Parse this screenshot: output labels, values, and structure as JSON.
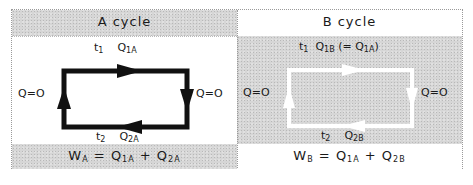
{
  "panels": {
    "a": {
      "title": "A  cycle",
      "top_label": {
        "t": "t",
        "t_sub": "1",
        "q": "Q",
        "q_sub": "1A"
      },
      "bottom_label": {
        "t": "t",
        "t_sub": "2",
        "q": "Q",
        "q_sub": "2A"
      },
      "left_label": "Q=O",
      "right_label": "Q=O",
      "formula": {
        "w": "W",
        "w_sub": "A",
        "eq": " = ",
        "q1": "Q",
        "q1_sub": "1A",
        "plus": " + ",
        "q2": "Q",
        "q2_sub": "2A"
      },
      "cycle_color": "#111111",
      "direction": "clockwise"
    },
    "b": {
      "title": "B  cycle",
      "top_label": {
        "t": "t",
        "t_sub": "1",
        "q": "Q",
        "q_sub": "1B",
        "note": "(= Q",
        "note_sub": "1A",
        "note_end": ")"
      },
      "bottom_label": {
        "t": "t",
        "t_sub": "2",
        "q": "Q",
        "q_sub": "2B"
      },
      "left_label": "Q=O",
      "right_label": "Q=O",
      "formula": {
        "w": "W",
        "w_sub": "B",
        "eq": " = ",
        "q1": "Q",
        "q1_sub": "1A",
        "plus": " + ",
        "q2": "Q",
        "q2_sub": "2B"
      },
      "cycle_color": "#ffffff",
      "direction": "clockwise"
    }
  }
}
